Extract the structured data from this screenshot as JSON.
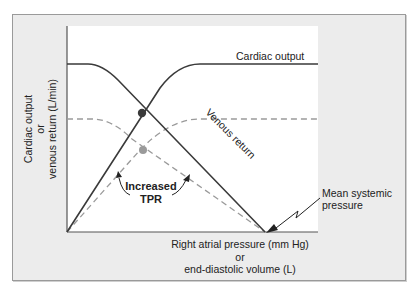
{
  "figure": {
    "y_axis_label": [
      "Cardiac output",
      "or",
      "venous return (L/min)"
    ],
    "x_axis_label": [
      "Right atrial pressure (mm Hg)",
      "or",
      "end-diastolic volume (L)"
    ],
    "curve_labels": {
      "cardiac_output": "Cardiac output",
      "venous_return": "Venous return"
    },
    "annotation": {
      "tpr_line1": "Increased",
      "tpr_line2": "TPR",
      "msp_line1": "Mean systemic",
      "msp_line2": "pressure"
    },
    "colors": {
      "solid_curve": "#3a3a3a",
      "dashed_curve": "#9a9a9a",
      "equilibrium_dot": "#3a3a3a",
      "new_equilibrium_dot": "#9a9a9a",
      "frame_bg": "#ececec",
      "plot_bg": "#ffffff"
    }
  }
}
